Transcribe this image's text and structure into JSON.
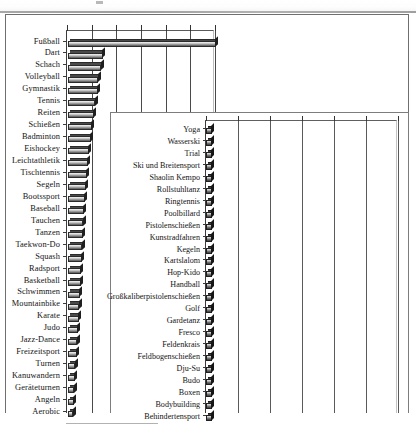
{
  "figure": {
    "background_color": "#ffffff",
    "frame_color": "#6f6f6f",
    "bar_fill_color": "#9d9d9d",
    "bar_outline_color": "#2b2b2b",
    "gridline_color": "#4a4a4a"
  },
  "chart_data": [
    {
      "id": "main-chart",
      "type": "bar",
      "orientation": "horizontal",
      "title": "",
      "xlabel": "",
      "ylabel": "",
      "grid": true,
      "legend": "none",
      "axis_position": "top",
      "xlim": [
        0,
        100
      ],
      "xticks": [
        0,
        16.7,
        33.3,
        50,
        66.7,
        83.3,
        100
      ],
      "xticklabels": [
        "",
        "",
        "",
        "",
        "",
        "",
        ""
      ],
      "categories": [
        "Fußball",
        "Dart",
        "Schach",
        "Volleyball",
        "Gymnastik",
        "Tennis",
        "Reiten",
        "Schießen",
        "Badminton",
        "Eishockey",
        "Leichtathletik",
        "Tischtennis",
        "Segeln",
        "Bootssport",
        "Baseball",
        "Tauchen",
        "Tanzen",
        "Taekwon-Do",
        "Squash",
        "Radsport",
        "Basketball",
        "Schwimmen",
        "Mountainbike",
        "Karate",
        "Judo",
        "Jazz-Dance",
        "Freizeitsport",
        "Turnen",
        "Kanuwandern",
        "Geräteturnen",
        "Angeln",
        "Aerobic"
      ],
      "values": [
        100,
        23.5,
        22.5,
        20.5,
        20.0,
        18.5,
        17.5,
        16.0,
        15.5,
        14.0,
        13.5,
        12.5,
        12.0,
        11.5,
        10.8,
        10.4,
        10.0,
        9.6,
        9.2,
        8.8,
        8.5,
        8.0,
        7.6,
        7.2,
        6.8,
        6.4,
        6.0,
        5.0,
        4.6,
        4.3,
        4.0,
        3.6
      ]
    },
    {
      "id": "inset-chart",
      "type": "bar",
      "orientation": "horizontal",
      "title": "",
      "xlabel": "",
      "ylabel": "",
      "grid": true,
      "legend": "none",
      "axis_position": "top",
      "xlim": [
        0,
        100
      ],
      "xticks": [
        0,
        16.7,
        33.3,
        50,
        66.7,
        83.3,
        100
      ],
      "xticklabels": [
        "",
        "",
        "",
        "",
        "",
        "",
        ""
      ],
      "categories": [
        "Yoga",
        "Wasserski",
        "Trial",
        "Ski und Breitensport",
        "Shaolin Kempo",
        "Rollstuhltanz",
        "Ringtennis",
        "Poolbillard",
        "Pistolenschießen",
        "Kunstradfahren",
        "Kegeln",
        "Kartslalom",
        "Hop-Kido",
        "Handball",
        "Großkaliberpistolenschießen",
        "Golf",
        "Gardetanz",
        "Fresco",
        "Feldenkrais",
        "Feldbogenschießen",
        "Dju-Su",
        "Budo",
        "Boxen",
        "Bodybuilding",
        "Behindertensport"
      ],
      "values": [
        3.0,
        3.0,
        3.0,
        3.0,
        3.0,
        3.0,
        3.0,
        3.0,
        3.0,
        3.0,
        3.0,
        3.0,
        3.0,
        3.0,
        3.0,
        3.0,
        3.0,
        3.0,
        3.0,
        3.0,
        3.0,
        3.0,
        3.0,
        3.0,
        3.0
      ]
    }
  ]
}
